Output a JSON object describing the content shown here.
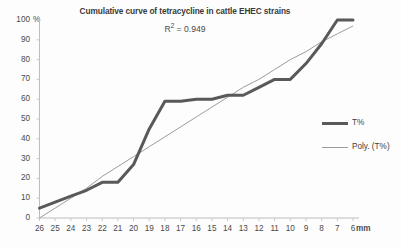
{
  "chart_data": {
    "type": "line",
    "title": "Cumulative curve of tetracycline in cattle EHEC strains",
    "subtitle": "R² = 0.949",
    "annotation_r2_prefix": "R",
    "annotation_r2_sup": "2",
    "annotation_r2_value": " = 0.949",
    "xlabel": "mm",
    "ylabel": "%",
    "grid": false,
    "legend_position": "right",
    "categories": [
      26,
      25,
      24,
      23,
      22,
      21,
      20,
      19,
      18,
      17,
      16,
      15,
      14,
      13,
      12,
      11,
      10,
      9,
      8,
      7,
      6
    ],
    "xtick_labels": [
      "26",
      "25",
      "24",
      "23",
      "22",
      "21",
      "20",
      "19",
      "18",
      "17",
      "16",
      "15",
      "14",
      "13",
      "12",
      "11",
      "10",
      "9",
      "8",
      "7",
      "6"
    ],
    "ytick_labels": [
      "100",
      "90",
      "80",
      "70",
      "60",
      "50",
      "40",
      "30",
      "20",
      "10",
      "0"
    ],
    "ytick_values": [
      100,
      90,
      80,
      70,
      60,
      50,
      40,
      30,
      20,
      10,
      0
    ],
    "ylim": [
      0,
      100
    ],
    "xlim": [
      26,
      6
    ],
    "series": [
      {
        "name": "T%",
        "type": "line",
        "color": "#595959",
        "width": 3,
        "values": [
          5,
          8,
          11,
          14,
          18,
          18,
          27,
          45,
          59,
          59,
          60,
          60,
          62,
          62,
          66,
          70,
          70,
          78,
          88,
          100,
          100
        ]
      },
      {
        "name": "Poly. (T%)",
        "type": "trendline",
        "color": "#9c9c9c",
        "width": 1,
        "values": [
          0,
          5,
          10,
          15,
          21,
          26,
          31,
          36,
          41,
          46,
          51,
          56,
          61,
          66,
          70,
          75,
          80,
          84,
          89,
          93,
          97
        ]
      }
    ],
    "legend": [
      {
        "label": "T%",
        "swatch": "series"
      },
      {
        "label": "Poly. (T%)",
        "swatch": "trend"
      }
    ]
  },
  "y_unit_label": "%",
  "x_unit_label": "mm"
}
